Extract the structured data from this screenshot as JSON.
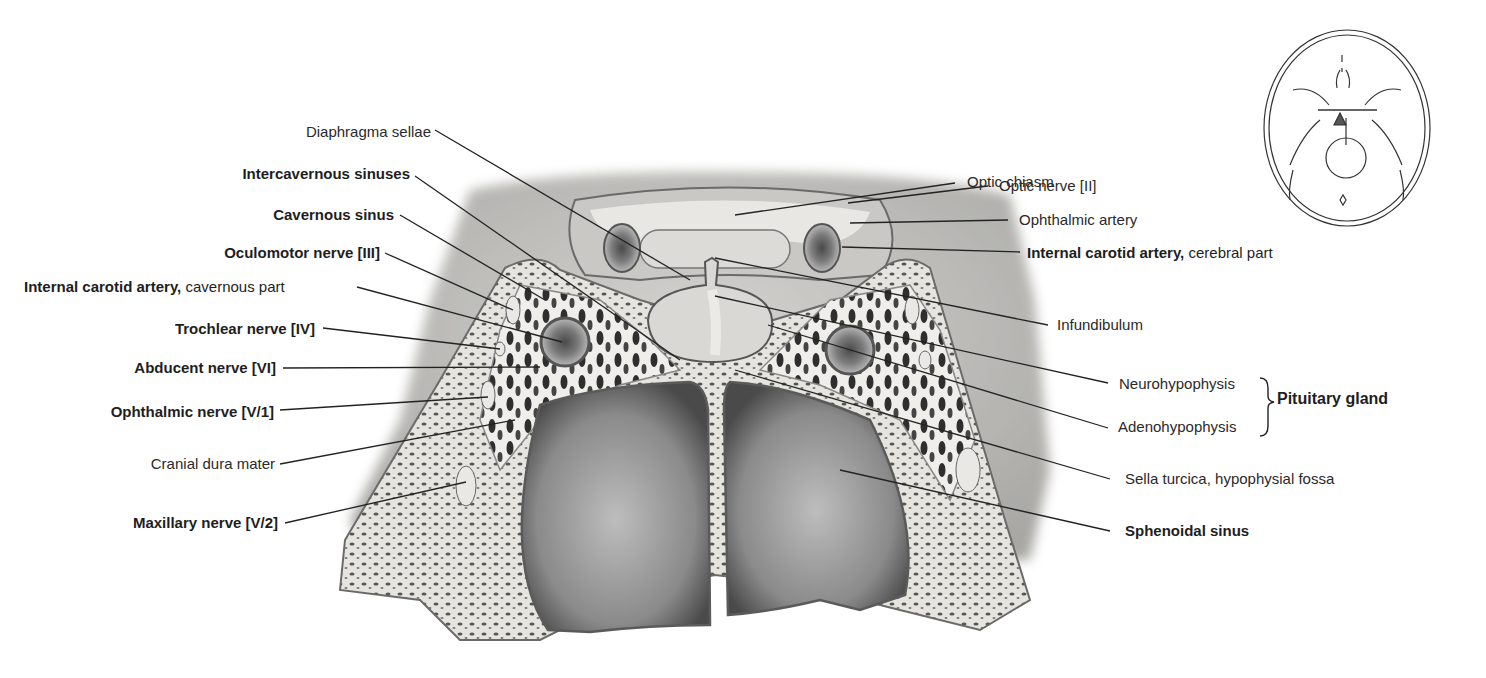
{
  "figure": {
    "colors": {
      "background": "#ffffff",
      "bone": "#e4e2dc",
      "dura": "#b9b7b2",
      "dark": "#3a3a3a",
      "leader": "#222222"
    }
  },
  "labels_left": [
    {
      "id": "diaphragma-sellae",
      "text": "Diaphragma sellae",
      "bold": false
    },
    {
      "id": "intercavernous-sinuses",
      "text": "Intercavernous sinuses",
      "bold": true
    },
    {
      "id": "cavernous-sinus",
      "text": "Cavernous sinus",
      "bold": true
    },
    {
      "id": "oculomotor-nerve",
      "text": "Oculomotor nerve [III]",
      "bold": true
    },
    {
      "id": "ica-cavernous",
      "text": "Internal carotid artery,",
      "suffix": " cavernous part",
      "bold": true
    },
    {
      "id": "trochlear-nerve",
      "text": "Trochlear nerve [IV]",
      "bold": true
    },
    {
      "id": "abducent-nerve",
      "text": "Abducent nerve [VI]",
      "bold": true
    },
    {
      "id": "ophthalmic-nerve",
      "text": "Ophthalmic nerve [V/1]",
      "bold": true
    },
    {
      "id": "cranial-dura-mater",
      "text": "Cranial dura mater",
      "bold": false
    },
    {
      "id": "maxillary-nerve",
      "text": "Maxillary nerve [V/2]",
      "bold": true
    }
  ],
  "labels_right": [
    {
      "id": "optic-chiasm",
      "text": "Optic chiasm",
      "bold": false
    },
    {
      "id": "optic-nerve",
      "text": "Optic nerve [II]",
      "bold": false
    },
    {
      "id": "ophthalmic-artery",
      "text": "Ophthalmic artery",
      "bold": false
    },
    {
      "id": "ica-cerebral",
      "text": "Internal carotid artery,",
      "suffix": " cerebral part",
      "bold": true
    },
    {
      "id": "infundibulum",
      "text": "Infundibulum",
      "bold": false
    },
    {
      "id": "neurohypophysis",
      "text": "Neurohypophysis",
      "bold": false
    },
    {
      "id": "adenohypophysis",
      "text": "Adenohypophysis",
      "bold": false
    },
    {
      "id": "sella-turcica",
      "text": "Sella turcica, hypophysial fossa",
      "bold": false
    },
    {
      "id": "sphenoidal-sinus",
      "text": "Sphenoidal sinus",
      "bold": true
    }
  ],
  "group_label": {
    "text": "Pituitary gland",
    "groups": [
      "Neurohypophysis",
      "Adenohypophysis"
    ]
  },
  "orientation_inset": {
    "description": "Skull base outline (superior view) with section plane marker"
  }
}
